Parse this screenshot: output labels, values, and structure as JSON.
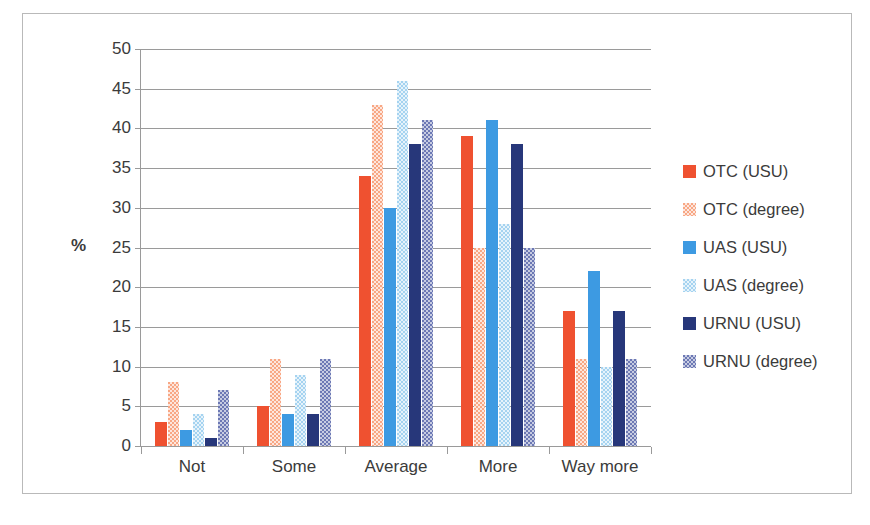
{
  "chart_data": {
    "type": "bar",
    "title": "",
    "xlabel": "",
    "ylabel": "%",
    "ylim": [
      0,
      50
    ],
    "ytick_step": 5,
    "yticks": [
      50,
      45,
      40,
      35,
      30,
      25,
      20,
      15,
      10,
      5,
      0
    ],
    "grid": true,
    "legend_position": "right",
    "categories": [
      "Not",
      "Some",
      "Average",
      "More",
      "Way more"
    ],
    "series": [
      {
        "name": "OTC (USU)",
        "color": "#ef5130",
        "pattern": "solid",
        "values": [
          3,
          5,
          34,
          39,
          17
        ]
      },
      {
        "name": "OTC (degree)",
        "color": "#f8a784",
        "pattern": "checkered",
        "values": [
          8,
          11,
          43,
          25,
          11
        ]
      },
      {
        "name": "UAS (USU)",
        "color": "#3d9ae2",
        "pattern": "solid",
        "values": [
          2,
          4,
          30,
          41,
          22
        ]
      },
      {
        "name": "UAS (degree)",
        "color": "#a5d3f0",
        "pattern": "checkered",
        "values": [
          4,
          9,
          46,
          28,
          10
        ]
      },
      {
        "name": "URNU (USU)",
        "color": "#27377a",
        "pattern": "solid",
        "values": [
          1,
          4,
          38,
          38,
          17
        ]
      },
      {
        "name": "URNU (degree)",
        "color": "#6c78b4",
        "pattern": "checkered",
        "values": [
          7,
          11,
          41,
          25,
          11
        ]
      }
    ]
  },
  "axis": {
    "y_title": "%"
  }
}
